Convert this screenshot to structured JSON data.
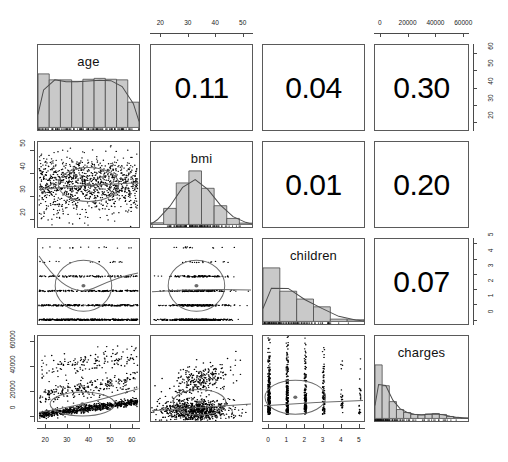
{
  "figure": {
    "type": "pairs-panels scatterplot matrix",
    "variables": [
      "age",
      "bmi",
      "children",
      "charges"
    ],
    "diagonal_labels": [
      "age",
      "bmi",
      "children",
      "charges"
    ]
  },
  "correlations": {
    "age_bmi": "0.11",
    "age_children": "0.04",
    "age_charges": "0.30",
    "bmi_children": "0.01",
    "bmi_charges": "0.20",
    "children_charges": "0.07"
  },
  "axes": {
    "top_bmi": {
      "labels": [
        "20",
        "30",
        "40",
        "50"
      ],
      "values": [
        20,
        30,
        40,
        50
      ]
    },
    "top_charges": {
      "labels": [
        "0",
        "20000",
        "40000",
        "60000"
      ],
      "values": [
        0,
        20000,
        40000,
        60000
      ]
    },
    "right_age": {
      "labels": [
        "60",
        "50",
        "40",
        "30",
        "20"
      ],
      "values": [
        60,
        50,
        40,
        30,
        20
      ]
    },
    "right_children": {
      "labels": [
        "5",
        "4",
        "3",
        "2",
        "1",
        "0"
      ],
      "values": [
        5,
        4,
        3,
        2,
        1,
        0
      ]
    },
    "left_bmi": {
      "labels": [
        "50",
        "40",
        "30",
        "20"
      ],
      "values": [
        50,
        40,
        30,
        20
      ]
    },
    "left_charges": {
      "labels": [
        "60000",
        "40000",
        "20000",
        "0"
      ],
      "values": [
        60000,
        40000,
        20000,
        0
      ]
    },
    "bottom_age": {
      "labels": [
        "20",
        "30",
        "40",
        "50",
        "60"
      ],
      "values": [
        20,
        30,
        40,
        50,
        60
      ]
    },
    "bottom_children": {
      "labels": [
        "0",
        "1",
        "2",
        "3",
        "4",
        "5"
      ],
      "values": [
        0,
        1,
        2,
        3,
        4,
        5
      ]
    }
  },
  "chart_data": {
    "type": "scatter",
    "title": "",
    "xlabel": "",
    "ylabel": "",
    "variables": [
      "age",
      "bmi",
      "children",
      "charges"
    ],
    "matrix_layout": {
      "diagonal": "histogram with density curve and rug",
      "upper_triangle": "correlation coefficient text",
      "lower_triangle": "scatter with loess smoother and confidence ellipse"
    },
    "correlation_matrix": [
      [
        1.0,
        0.11,
        0.04,
        0.3
      ],
      [
        0.11,
        1.0,
        0.01,
        0.2
      ],
      [
        0.04,
        0.01,
        1.0,
        0.07
      ],
      [
        0.3,
        0.2,
        0.07,
        1.0
      ]
    ],
    "histograms": [
      {
        "variable": "age",
        "xlim": [
          18,
          64
        ],
        "bin_edges": [
          18,
          23,
          28,
          33,
          38,
          43,
          48,
          53,
          58,
          64
        ],
        "counts": [
          180,
          160,
          160,
          155,
          162,
          165,
          162,
          160,
          85
        ],
        "density_curve": "broad flat multimodal"
      },
      {
        "variable": "bmi",
        "xlim": [
          16,
          53
        ],
        "bin_edges": [
          15,
          20,
          25,
          30,
          35,
          40,
          45,
          50,
          55
        ],
        "counts": [
          12,
          120,
          310,
          400,
          270,
          140,
          45,
          10
        ],
        "density_curve": "approximately normal, peak near 30"
      },
      {
        "variable": "children",
        "xlim": [
          0,
          5
        ],
        "bin_edges": [
          0,
          1,
          2,
          3,
          4,
          5
        ],
        "counts": [
          574,
          324,
          240,
          157,
          25,
          18
        ],
        "density_curve": "monotone decreasing"
      },
      {
        "variable": "charges",
        "xlim": [
          0,
          64000
        ],
        "bin_edges": [
          0,
          5000,
          10000,
          15000,
          20000,
          25000,
          30000,
          35000,
          40000,
          45000,
          50000,
          55000,
          60000,
          64000
        ],
        "counts": [
          540,
          330,
          170,
          90,
          60,
          40,
          35,
          45,
          50,
          40,
          20,
          10,
          5
        ],
        "density_curve": "right skewed with long tail"
      }
    ],
    "scatter_pairs": [
      {
        "x": "age",
        "y": "bmi",
        "xlim": [
          18,
          64
        ],
        "ylim": [
          16,
          53
        ],
        "n": 1338,
        "r": 0.11,
        "pattern": "dense uniform cloud, near-flat smoother"
      },
      {
        "x": "age",
        "y": "children",
        "xlim": [
          18,
          64
        ],
        "ylim": [
          0,
          5
        ],
        "n": 1338,
        "r": 0.04,
        "pattern": "discrete horizontal bands at 0-5 children, flat smoother"
      },
      {
        "x": "bmi",
        "y": "children",
        "xlim": [
          16,
          53
        ],
        "ylim": [
          0,
          5
        ],
        "n": 1338,
        "r": 0.01,
        "pattern": "discrete horizontal bands, flat smoother"
      },
      {
        "x": "age",
        "y": "charges",
        "xlim": [
          18,
          64
        ],
        "ylim": [
          0,
          64000
        ],
        "n": 1338,
        "r": 0.3,
        "pattern": "three upward-sloping curved bands (non-smokers, mixed, smokers)"
      },
      {
        "x": "bmi",
        "y": "charges",
        "xlim": [
          16,
          53
        ],
        "ylim": [
          0,
          64000
        ],
        "n": 1338,
        "r": 0.2,
        "pattern": "dense low band with upward-sloping high-cost cluster above bmi 30"
      },
      {
        "x": "children",
        "y": "charges",
        "xlim": [
          0,
          5
        ],
        "ylim": [
          0,
          64000
        ],
        "n": 1338,
        "r": 0.07,
        "pattern": "vertical stripes at integer children values, flat smoother"
      }
    ]
  },
  "colors": {
    "panel_border": "#5a5a5a",
    "hist_fill": "#c9c9c9",
    "hist_border": "#4a4a4a",
    "point": "#000000",
    "curve": "#6b6b6b",
    "background": "#ffffff"
  }
}
